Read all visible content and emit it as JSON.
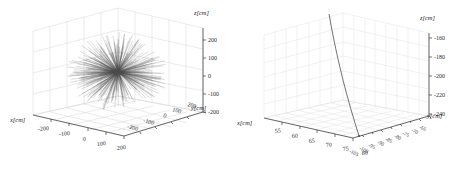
{
  "figure": {
    "background_color": "#ffffff",
    "width": 462,
    "height": 172,
    "panel_count": 2
  },
  "chart_data": [
    {
      "type": "scatter",
      "name": "left-panel",
      "projection": "3d",
      "title": "",
      "xlabel": "x[cm]",
      "ylabel": "y[cm]",
      "zlabel": "z[cm]",
      "xticks": [
        -200,
        -100,
        0,
        100,
        200
      ],
      "yticks": [
        200,
        100,
        0,
        -100,
        -200
      ],
      "zticks": [
        200,
        100,
        0,
        -100,
        -200
      ],
      "xtick_labels": [
        "-200",
        "-100",
        "0",
        "100",
        "200"
      ],
      "ytick_labels": [
        "200",
        "100",
        "0",
        "-100",
        "-200"
      ],
      "ztick_labels": [
        "200",
        "100",
        "0",
        "-100",
        "-200"
      ],
      "xlim": [
        -260,
        260
      ],
      "ylim": [
        -260,
        260
      ],
      "zlim": [
        -260,
        260
      ],
      "grid": true,
      "legend": "none",
      "description": "Dense isotropic burst of many straight track segments radiating outward from a common vertex near the centre of the cube",
      "series": [
        {
          "name": "tracks",
          "style": "lines",
          "color": "#4a4a4a",
          "count": 420,
          "origin": [
            0,
            0,
            0
          ],
          "radial_spread_cm": 230
        }
      ]
    },
    {
      "type": "line",
      "name": "right-panel",
      "projection": "3d",
      "title": "",
      "xlabel": "x[cm]",
      "ylabel": "y[cm]",
      "zlabel": "z[cm]",
      "xticks": [
        55,
        60,
        65,
        70,
        75,
        80
      ],
      "yticks": [
        -105,
        -100,
        -95,
        -90,
        -85,
        -80,
        -75,
        -70,
        -65
      ],
      "zticks": [
        -160,
        -180,
        -200,
        -220,
        -240
      ],
      "xtick_labels": [
        "55",
        "60",
        "65",
        "70",
        "75",
        "80"
      ],
      "ytick_labels": [
        "-105",
        "-100",
        "-95",
        "-90",
        "-85",
        "-80",
        "-75",
        "-70",
        "-65"
      ],
      "ztick_labels": [
        "-160",
        "-180",
        "-200",
        "-220",
        "-240"
      ],
      "xlim": [
        53,
        82
      ],
      "ylim": [
        -107,
        -63
      ],
      "zlim": [
        -250,
        -150
      ],
      "grid": true,
      "legend": "none",
      "description": "Single nearly-vertical slightly curved particle track descending through the volume",
      "series": [
        {
          "name": "track",
          "style": "line",
          "color": "#555555",
          "points": [
            [
              66.0,
              -83.0,
              -152.0
            ],
            [
              67.1,
              -84.0,
              -165.0
            ],
            [
              68.3,
              -85.1,
              -180.0
            ],
            [
              69.6,
              -86.2,
              -195.0
            ],
            [
              71.0,
              -87.4,
              -210.0
            ],
            [
              72.5,
              -88.6,
              -225.0
            ],
            [
              74.1,
              -89.9,
              -240.0
            ],
            [
              75.4,
              -91.0,
              -249.0
            ]
          ]
        }
      ]
    }
  ]
}
